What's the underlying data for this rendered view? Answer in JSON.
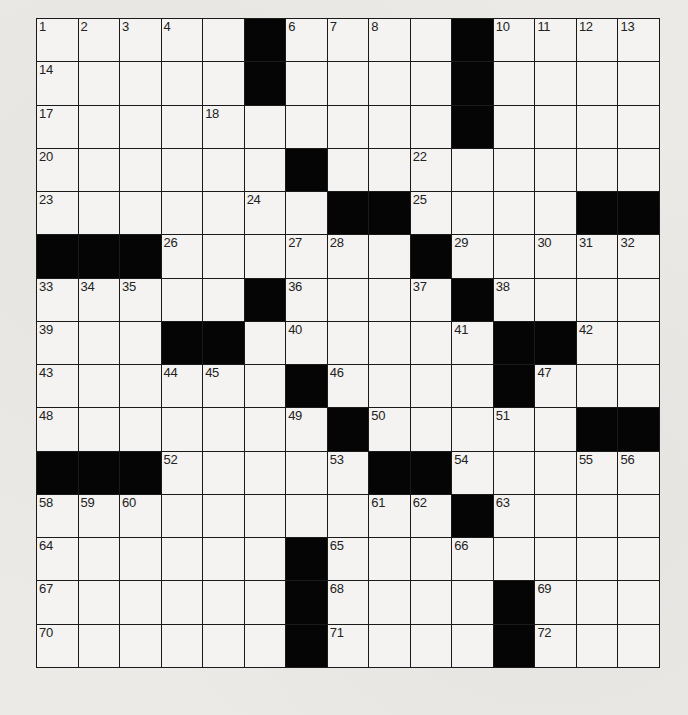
{
  "puzzle": {
    "rows": 15,
    "cols": 15,
    "colors": {
      "black": "#050505",
      "white": "#f4f3f1",
      "line": "#1a1a1a",
      "number": "#222222"
    },
    "layout": [
      ".....#....#.....",
      ""
    ],
    "grid": [
      [
        "1",
        "2",
        "3",
        "4",
        "#",
        "5",
        "6",
        "7",
        "8",
        "#",
        "9",
        "10",
        "11",
        "12",
        "13"
      ],
      [
        "14",
        "",
        "",
        "",
        "#",
        "15",
        "",
        "",
        "",
        "#",
        "16",
        "",
        "",
        "",
        ""
      ],
      [
        "17",
        "",
        "",
        "",
        "18",
        "",
        "",
        "",
        "",
        "#",
        "19",
        "",
        "",
        "",
        ""
      ],
      [
        "20",
        "",
        "",
        "",
        "",
        "",
        "#",
        "21",
        "",
        "",
        "22",
        "",
        "",
        "",
        ""
      ],
      [
        "23",
        "",
        "",
        "",
        "",
        "",
        "24",
        "#",
        "#",
        "25",
        "",
        "",
        "",
        "#",
        "#"
      ],
      [
        "#",
        "#",
        "#",
        "26",
        "",
        "",
        "",
        "27",
        "28",
        "#",
        "29",
        "",
        "",
        "30",
        "31",
        "32"
      ],
      [
        "33",
        "34",
        "35",
        "",
        "",
        "#",
        "36",
        "",
        "",
        "37",
        "#",
        "38",
        "",
        "",
        "",
        ""
      ],
      [
        "39",
        "",
        "",
        "#",
        "#",
        "40",
        "",
        "",
        "",
        "41",
        "#",
        "#",
        "42",
        "",
        ""
      ],
      [
        "43",
        "",
        "",
        "44",
        "45",
        "#",
        "46",
        "",
        "",
        "",
        "#",
        "47",
        "",
        "",
        ""
      ],
      [
        "48",
        "",
        "",
        "",
        "",
        "",
        "49",
        "#",
        "50",
        "",
        "",
        "51",
        "",
        "#",
        "#"
      ],
      [
        "#",
        "#",
        "#",
        "52",
        "",
        "",
        "",
        "53",
        "#",
        "#",
        "54",
        "",
        "",
        "55",
        "56",
        "57"
      ],
      [
        "58",
        "59",
        "60",
        "",
        "",
        "",
        "",
        "",
        "61",
        "62",
        "#",
        "63",
        "",
        "",
        ""
      ],
      [
        "64",
        "",
        "",
        "",
        "",
        "#",
        "65",
        "",
        "",
        "",
        "66",
        "",
        "",
        "",
        ""
      ],
      [
        "67",
        "",
        "",
        "",
        "",
        "#",
        "68",
        "",
        "",
        "",
        "#",
        "69",
        "",
        "",
        ""
      ],
      [
        "70",
        "",
        "",
        "",
        "",
        "#",
        "71",
        "",
        "",
        "",
        "#",
        "72",
        "",
        "",
        ""
      ]
    ],
    "blacks": [
      [
        0,
        5
      ],
      [
        0,
        10
      ],
      [
        1,
        5
      ],
      [
        1,
        10
      ],
      [
        2,
        10
      ],
      [
        3,
        6
      ],
      [
        4,
        7
      ],
      [
        4,
        8
      ],
      [
        4,
        13
      ],
      [
        4,
        14
      ],
      [
        5,
        0
      ],
      [
        5,
        1
      ],
      [
        5,
        2
      ],
      [
        5,
        9
      ],
      [
        6,
        5
      ],
      [
        6,
        10
      ],
      [
        7,
        3
      ],
      [
        7,
        4
      ],
      [
        7,
        11
      ],
      [
        7,
        12
      ],
      [
        8,
        6
      ],
      [
        8,
        11
      ],
      [
        9,
        7
      ],
      [
        9,
        13
      ],
      [
        9,
        14
      ],
      [
        10,
        0
      ],
      [
        10,
        1
      ],
      [
        10,
        2
      ],
      [
        10,
        8
      ],
      [
        10,
        9
      ],
      [
        11,
        10
      ],
      [
        12,
        6
      ],
      [
        13,
        6
      ],
      [
        13,
        11
      ],
      [
        14,
        6
      ],
      [
        14,
        11
      ]
    ],
    "numbers": [
      {
        "r": 0,
        "c": 0,
        "n": "1"
      },
      {
        "r": 0,
        "c": 1,
        "n": "2"
      },
      {
        "r": 0,
        "c": 2,
        "n": "3"
      },
      {
        "r": 0,
        "c": 3,
        "n": "4"
      },
      {
        "r": 0,
        "c": 5,
        "n": "5"
      },
      {
        "r": 0,
        "c": 6,
        "n": "6"
      },
      {
        "r": 0,
        "c": 7,
        "n": "7"
      },
      {
        "r": 0,
        "c": 8,
        "n": "8"
      },
      {
        "r": 0,
        "c": 10,
        "n": "9"
      },
      {
        "r": 0,
        "c": 11,
        "n": "10"
      },
      {
        "r": 0,
        "c": 12,
        "n": "11"
      },
      {
        "r": 0,
        "c": 13,
        "n": "12"
      },
      {
        "r": 0,
        "c": 14,
        "n": "13"
      },
      {
        "r": 1,
        "c": 0,
        "n": "14"
      },
      {
        "r": 1,
        "c": 5,
        "n": "15"
      },
      {
        "r": 1,
        "c": 10,
        "n": "16"
      },
      {
        "r": 2,
        "c": 0,
        "n": "17"
      },
      {
        "r": 2,
        "c": 4,
        "n": "18"
      },
      {
        "r": 2,
        "c": 10,
        "n": "19"
      },
      {
        "r": 3,
        "c": 0,
        "n": "20"
      },
      {
        "r": 3,
        "c": 6,
        "n": "21"
      },
      {
        "r": 3,
        "c": 9,
        "n": "22"
      },
      {
        "r": 4,
        "c": 0,
        "n": "23"
      },
      {
        "r": 4,
        "c": 5,
        "n": "24"
      },
      {
        "r": 4,
        "c": 9,
        "n": "25"
      },
      {
        "r": 5,
        "c": 3,
        "n": "26"
      },
      {
        "r": 5,
        "c": 6,
        "n": "27"
      },
      {
        "r": 5,
        "c": 7,
        "n": "28"
      },
      {
        "r": 5,
        "c": 10,
        "n": "29"
      },
      {
        "r": 5,
        "c": 12,
        "n": "30"
      },
      {
        "r": 5,
        "c": 13,
        "n": "31"
      },
      {
        "r": 5,
        "c": 14,
        "n": "32"
      },
      {
        "r": 6,
        "c": 0,
        "n": "33"
      },
      {
        "r": 6,
        "c": 1,
        "n": "34"
      },
      {
        "r": 6,
        "c": 2,
        "n": "35"
      },
      {
        "r": 6,
        "c": 6,
        "n": "36"
      },
      {
        "r": 6,
        "c": 9,
        "n": "37"
      },
      {
        "r": 6,
        "c": 11,
        "n": "38"
      },
      {
        "r": 7,
        "c": 0,
        "n": "39"
      },
      {
        "r": 7,
        "c": 6,
        "n": "40"
      },
      {
        "r": 7,
        "c": 10,
        "n": "41"
      },
      {
        "r": 7,
        "c": 13,
        "n": "42"
      },
      {
        "r": 8,
        "c": 0,
        "n": "43"
      },
      {
        "r": 8,
        "c": 3,
        "n": "44"
      },
      {
        "r": 8,
        "c": 4,
        "n": "45"
      },
      {
        "r": 8,
        "c": 7,
        "n": "46"
      },
      {
        "r": 8,
        "c": 12,
        "n": "47"
      },
      {
        "r": 9,
        "c": 0,
        "n": "48"
      },
      {
        "r": 9,
        "c": 6,
        "n": "49"
      },
      {
        "r": 9,
        "c": 8,
        "n": "50"
      },
      {
        "r": 9,
        "c": 11,
        "n": "51"
      },
      {
        "r": 10,
        "c": 3,
        "n": "52"
      },
      {
        "r": 10,
        "c": 7,
        "n": "53"
      },
      {
        "r": 10,
        "c": 10,
        "n": "54"
      },
      {
        "r": 10,
        "c": 13,
        "n": "55"
      },
      {
        "r": 10,
        "c": 14,
        "n": "56"
      },
      {
        "r": 11,
        "c": 0,
        "n": "58"
      },
      {
        "r": 11,
        "c": 1,
        "n": "59"
      },
      {
        "r": 11,
        "c": 2,
        "n": "60"
      },
      {
        "r": 11,
        "c": 8,
        "n": "61"
      },
      {
        "r": 11,
        "c": 9,
        "n": "62"
      },
      {
        "r": 11,
        "c": 11,
        "n": "63"
      },
      {
        "r": 12,
        "c": 0,
        "n": "64"
      },
      {
        "r": 12,
        "c": 7,
        "n": "65"
      },
      {
        "r": 12,
        "c": 10,
        "n": "66"
      },
      {
        "r": 13,
        "c": 0,
        "n": "67"
      },
      {
        "r": 13,
        "c": 7,
        "n": "68"
      },
      {
        "r": 13,
        "c": 12,
        "n": "69"
      },
      {
        "r": 14,
        "c": 0,
        "n": "70"
      },
      {
        "r": 14,
        "c": 7,
        "n": "71"
      },
      {
        "r": 14,
        "c": 12,
        "n": "72"
      }
    ]
  }
}
